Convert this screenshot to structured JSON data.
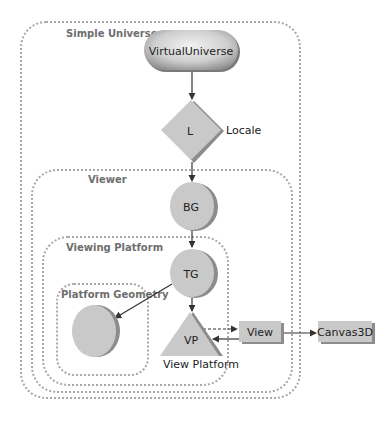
{
  "diagram": {
    "type": "scene-graph",
    "groups": {
      "simple_universe": "Simple Universe",
      "viewer": "Viewer",
      "viewing_platform": "Viewing Platform",
      "platform_geometry": "Platform Geometry"
    },
    "nodes": {
      "virtual_universe": {
        "label": "VirtualUniverse",
        "shape": "capsule"
      },
      "locale": {
        "label": "L",
        "caption": "Locale",
        "shape": "diamond"
      },
      "branch_group": {
        "label": "BG",
        "shape": "circle"
      },
      "transform_group": {
        "label": "TG",
        "shape": "circle"
      },
      "platform_geometry_node": {
        "label": "",
        "shape": "circle"
      },
      "view_platform": {
        "label": "VP",
        "caption": "View Platform",
        "shape": "triangle"
      },
      "view": {
        "label": "View",
        "shape": "rectangle"
      },
      "canvas3d": {
        "label": "Canvas3D",
        "shape": "rectangle"
      }
    },
    "edges": [
      {
        "from": "VirtualUniverse",
        "to": "L",
        "style": "solid"
      },
      {
        "from": "L",
        "to": "BG",
        "style": "solid"
      },
      {
        "from": "BG",
        "to": "TG",
        "style": "solid"
      },
      {
        "from": "TG",
        "to": "Platform Geometry circle",
        "style": "solid"
      },
      {
        "from": "TG",
        "to": "VP",
        "style": "solid"
      },
      {
        "from": "VP",
        "to": "View",
        "style": "dashed"
      },
      {
        "from": "View",
        "to": "VP",
        "style": "solid"
      },
      {
        "from": "View",
        "to": "Canvas3D",
        "style": "solid"
      }
    ],
    "colors": {
      "node_fill": "#c8c8c8",
      "node_shadow": "#8c8c8c",
      "group_border": "#a8a8a8",
      "group_label": "#6e6e6e",
      "edge": "#333333"
    }
  }
}
